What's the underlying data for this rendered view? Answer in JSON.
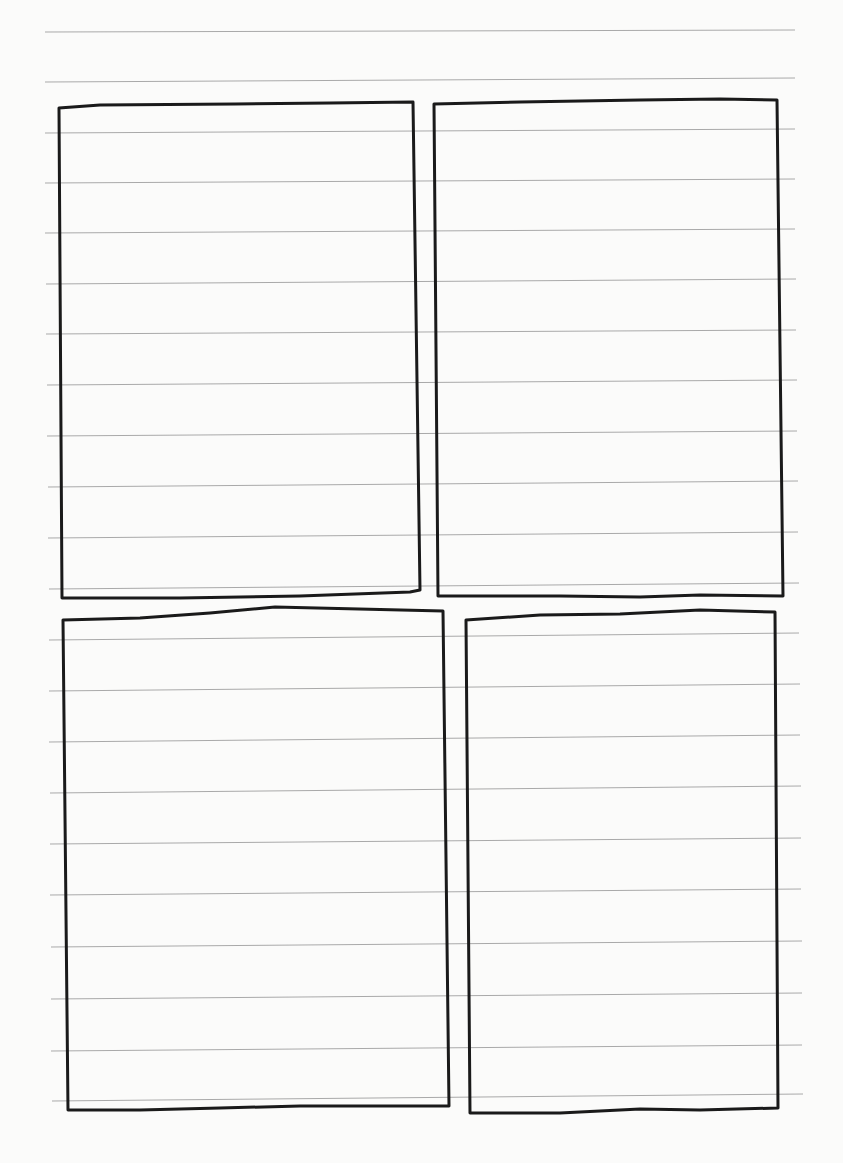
{
  "page": {
    "type": "lined-paper-storyboard-template",
    "background_color": "#fbfbfa",
    "rule_color": "#a9a9a9",
    "frame_color": "#1a1a1a",
    "rule_count": 21,
    "rule_spacing_px": 51
  },
  "rules": [
    {
      "x1": 45,
      "y1": 32,
      "x2": 795,
      "y2": 30
    },
    {
      "x1": 45,
      "y1": 82,
      "x2": 795,
      "y2": 78
    },
    {
      "x1": 45,
      "y1": 133,
      "x2": 795,
      "y2": 129
    },
    {
      "x1": 45,
      "y1": 183,
      "x2": 795,
      "y2": 179
    },
    {
      "x1": 45,
      "y1": 233,
      "x2": 795,
      "y2": 229
    },
    {
      "x1": 46,
      "y1": 284,
      "x2": 796,
      "y2": 279
    },
    {
      "x1": 46,
      "y1": 334,
      "x2": 796,
      "y2": 330
    },
    {
      "x1": 47,
      "y1": 385,
      "x2": 797,
      "y2": 380
    },
    {
      "x1": 47,
      "y1": 436,
      "x2": 797,
      "y2": 431
    },
    {
      "x1": 48,
      "y1": 487,
      "x2": 798,
      "y2": 481
    },
    {
      "x1": 48,
      "y1": 538,
      "x2": 798,
      "y2": 532
    },
    {
      "x1": 49,
      "y1": 589,
      "x2": 799,
      "y2": 583
    },
    {
      "x1": 49,
      "y1": 640,
      "x2": 799,
      "y2": 633
    },
    {
      "x1": 49,
      "y1": 691,
      "x2": 800,
      "y2": 684
    },
    {
      "x1": 49,
      "y1": 742,
      "x2": 800,
      "y2": 735
    },
    {
      "x1": 50,
      "y1": 793,
      "x2": 801,
      "y2": 786
    },
    {
      "x1": 50,
      "y1": 844,
      "x2": 801,
      "y2": 838
    },
    {
      "x1": 50,
      "y1": 895,
      "x2": 801,
      "y2": 889
    },
    {
      "x1": 51,
      "y1": 947,
      "x2": 802,
      "y2": 941
    },
    {
      "x1": 51,
      "y1": 999,
      "x2": 802,
      "y2": 993
    },
    {
      "x1": 51,
      "y1": 1051,
      "x2": 802,
      "y2": 1045
    },
    {
      "x1": 52,
      "y1": 1101,
      "x2": 803,
      "y2": 1094
    }
  ],
  "frames": [
    {
      "name": "frame-top-left",
      "path": "M59,108 L100,105 L235,104 L330,103 L413,102 L420,590 L410,592 L300,596 L180,598 L62,598 Z"
    },
    {
      "name": "frame-top-right",
      "path": "M434,104 L520,102 L640,100 L720,99 L777,100 L783,596 L700,595 L640,597 L560,596 L438,596 Z"
    },
    {
      "name": "frame-bottom-left",
      "path": "M63,620 L140,618 L210,613 L275,607 L443,611 L449,1106 L300,1106 L220,1108 L140,1110 L68,1110 Z"
    },
    {
      "name": "frame-bottom-right",
      "path": "M466,620 L540,615 L620,614 L700,610 L775,612 L778,1108 L700,1110 L640,1109 L560,1113 L470,1113 Z"
    }
  ]
}
